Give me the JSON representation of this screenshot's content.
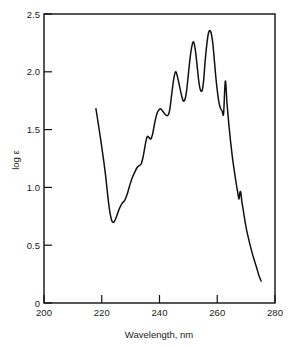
{
  "chart_data": {
    "type": "line",
    "title": "",
    "subtitle": "",
    "xlabel": "Wavelength,  nm",
    "ylabel": "log ε",
    "xlim": [
      200,
      280
    ],
    "ylim": [
      0,
      2.5
    ],
    "xticks": [
      200,
      220,
      240,
      260,
      280
    ],
    "xtick_labels": [
      "200",
      "220",
      "240",
      "260",
      "280"
    ],
    "yticks": [
      0,
      0.5,
      1.0,
      1.5,
      2.0,
      2.5
    ],
    "ytick_labels": [
      "0",
      "0.5",
      "1.0",
      "1.5",
      "2.0",
      "2.5"
    ],
    "grid": false,
    "legend": null,
    "legend_position": "none",
    "annotations": [],
    "series": [
      {
        "name": "absorption spectrum",
        "color": "#111111",
        "x": [
          218.0,
          218.8,
          219.6,
          220.4,
          221.2,
          221.9,
          222.5,
          223.0,
          223.5,
          224.2,
          225.0,
          226.0,
          227.0,
          228.0,
          228.8,
          229.6,
          230.5,
          231.4,
          232.2,
          233.0,
          233.6,
          234.2,
          234.8,
          235.3,
          235.8,
          236.4,
          237.0,
          237.6,
          238.2,
          238.8,
          239.3,
          239.8,
          240.3,
          240.8,
          241.4,
          242.0,
          242.6,
          243.1,
          243.6,
          244.0,
          244.5,
          245.0,
          245.6,
          246.2,
          246.9,
          247.6,
          248.2,
          248.8,
          249.4,
          250.0,
          250.6,
          251.2,
          251.8,
          252.4,
          253.0,
          253.6,
          254.2,
          254.8,
          255.3,
          255.8,
          256.4,
          257.0,
          257.7,
          258.4,
          259.0,
          259.6,
          260.2,
          260.7,
          261.2,
          261.7,
          262.2,
          262.8,
          263.4,
          264.2,
          265.0,
          265.8,
          266.6,
          267.3,
          267.9,
          268.3,
          268.7,
          269.2,
          269.8,
          270.6,
          271.5,
          272.4,
          273.3,
          274.2,
          275.0
        ],
        "y": [
          1.68,
          1.55,
          1.42,
          1.28,
          1.13,
          0.97,
          0.84,
          0.76,
          0.71,
          0.7,
          0.74,
          0.81,
          0.86,
          0.89,
          0.94,
          1.01,
          1.08,
          1.13,
          1.17,
          1.19,
          1.2,
          1.25,
          1.33,
          1.4,
          1.44,
          1.43,
          1.42,
          1.46,
          1.54,
          1.61,
          1.65,
          1.67,
          1.68,
          1.67,
          1.65,
          1.63,
          1.62,
          1.63,
          1.68,
          1.76,
          1.86,
          1.95,
          2.0,
          1.96,
          1.88,
          1.8,
          1.75,
          1.76,
          1.84,
          1.98,
          2.12,
          2.22,
          2.26,
          2.19,
          2.06,
          1.92,
          1.84,
          1.84,
          1.93,
          2.09,
          2.24,
          2.34,
          2.35,
          2.26,
          2.1,
          1.93,
          1.8,
          1.72,
          1.68,
          1.66,
          1.64,
          1.6,
          1.58,
          1.62,
          1.76,
          1.92,
          2.09,
          2.19,
          2.14,
          1.98,
          1.8,
          1.62,
          1.48,
          1.33,
          1.22,
          1.12,
          1.02,
          0.95,
          0.92
        ]
      },
      {
        "name": "absorption spectrum tail",
        "color": "#111111",
        "x": [
          255.0,
          255.8,
          256.6,
          257.4,
          258.2,
          259.0,
          259.8,
          260.4,
          261.0,
          261.6,
          262.2,
          262.8,
          263.4,
          264.0,
          264.6,
          265.2,
          265.8,
          266.4,
          267.0,
          267.5,
          267.9,
          268.2,
          268.5,
          268.9,
          269.4,
          270.1,
          270.9,
          271.8,
          272.7,
          273.6,
          274.4,
          275.2
        ],
        "y": [
          2.1,
          2.0,
          1.88,
          1.74,
          1.62,
          1.58,
          1.63,
          1.8,
          2.02,
          2.19,
          2.11,
          1.92,
          1.72,
          1.55,
          1.4,
          1.27,
          1.16,
          1.06,
          0.97,
          0.9,
          0.96,
          0.95,
          0.88,
          0.82,
          0.74,
          0.64,
          0.55,
          0.46,
          0.38,
          0.31,
          0.24,
          0.19
        ]
      }
    ]
  },
  "axes": {
    "xlabel_text": "Wavelength,  nm",
    "ylabel_text": "log ε"
  },
  "colors": {
    "curve": "#111111",
    "frame": "#111111",
    "background": "#ffffff",
    "text": "#1a1a1a"
  }
}
